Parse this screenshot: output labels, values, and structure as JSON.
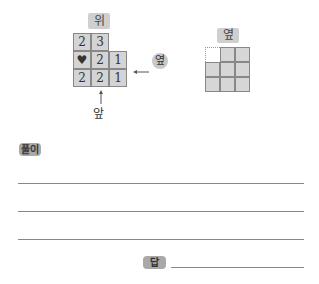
{
  "figure_left": {
    "top_label": "위",
    "front_label": "앞",
    "side_label": "옆",
    "grid": [
      [
        "2",
        "3",
        null
      ],
      [
        "♥",
        "2",
        "1"
      ],
      [
        "2",
        "2",
        "1"
      ]
    ]
  },
  "figure_right": {
    "label": "옆",
    "grid": [
      [
        false,
        true,
        true
      ],
      [
        true,
        true,
        true
      ],
      [
        true,
        true,
        true
      ]
    ]
  },
  "solution": {
    "label": "풀이",
    "line_count": 3
  },
  "answer": {
    "label": "답"
  }
}
